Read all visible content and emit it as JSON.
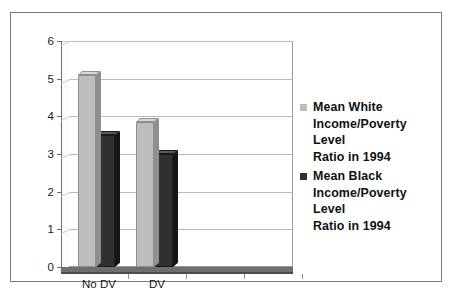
{
  "chart_data": {
    "type": "bar",
    "title": "",
    "xlabel": "",
    "ylabel": "",
    "ylim": [
      0,
      6
    ],
    "yticks": [
      "0",
      "1",
      "2",
      "3",
      "4",
      "5",
      "6"
    ],
    "grid": true,
    "legend_position": "right",
    "categories": [
      "No DV",
      "DV",
      "",
      ""
    ],
    "series": [
      {
        "name": "Mean White Income/Poverty Level Ratio in 1994",
        "color": "#bdbdbd",
        "values": [
          5.1,
          3.85,
          0,
          0
        ]
      },
      {
        "name": "Mean Black Income/Poverty Level Ratio in 1994",
        "color": "#303030",
        "values": [
          3.5,
          3.0,
          0,
          0
        ]
      }
    ]
  },
  "axis": {
    "y_tick_labels": [
      "6",
      "5",
      "4",
      "3",
      "2",
      "1",
      "0"
    ],
    "x_tick_labels": [
      "No DV",
      "DV"
    ]
  },
  "legend": {
    "entries": [
      {
        "swatch": "white-series-swatch",
        "line1": "Mean White",
        "line2": "Income/Poverty Level",
        "line3": "Ratio in 1994"
      },
      {
        "swatch": "black-series-swatch",
        "line1": "Mean Black",
        "line2": "Income/Poverty Level",
        "line3": "Ratio in 1994"
      }
    ]
  },
  "colors": {
    "white_series": "#bdbdbd",
    "black_series": "#303030",
    "grid": "#b9b9b9",
    "axis": "#6d6d6d",
    "border": "#7a7a7a"
  }
}
